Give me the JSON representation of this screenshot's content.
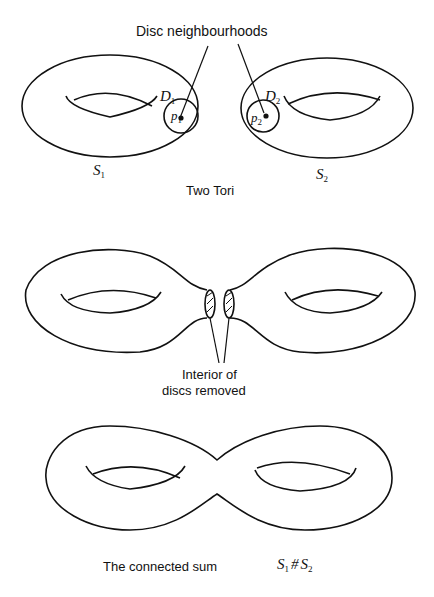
{
  "figure": {
    "panel1": {
      "title_top": "Disc neighbourhoods",
      "caption": "Two Tori",
      "left_surface": {
        "label": "S",
        "sub": "1"
      },
      "right_surface": {
        "label": "S",
        "sub": "2"
      },
      "left_disc": {
        "label": "D",
        "sub": "1"
      },
      "right_disc": {
        "label": "D",
        "sub": "2"
      },
      "left_point": {
        "label": "p",
        "sub": "1"
      },
      "right_point": {
        "label": "p",
        "sub": "2"
      }
    },
    "panel2": {
      "caption_line1": "Interior of",
      "caption_line2": "discs removed"
    },
    "panel3": {
      "caption": "The connected sum",
      "formula_a": "S",
      "formula_a_sub": "1",
      "formula_op": "#",
      "formula_b": "S",
      "formula_b_sub": "2"
    }
  },
  "colors": {
    "ink": "#111111",
    "background": "#ffffff"
  }
}
